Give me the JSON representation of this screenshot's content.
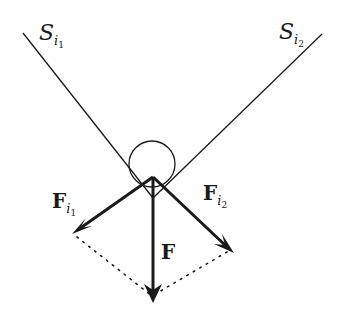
{
  "diagram": {
    "type": "force-decomposition",
    "surfaces": [
      {
        "name": "S",
        "subscript": "i",
        "sub_index": "1",
        "label": "S_i1"
      },
      {
        "name": "S",
        "subscript": "i",
        "sub_index": "2",
        "label": "S_i2"
      }
    ],
    "forces": [
      {
        "name": "F",
        "subscript": "i",
        "sub_index": "1",
        "label": "F_i1"
      },
      {
        "name": "F",
        "subscript": "i",
        "sub_index": "2",
        "label": "F_i2"
      },
      {
        "name": "F",
        "subscript": "",
        "sub_index": "",
        "label": "F"
      }
    ],
    "colors": {
      "stroke": "#1a1a1a",
      "background": "#ffffff"
    }
  }
}
